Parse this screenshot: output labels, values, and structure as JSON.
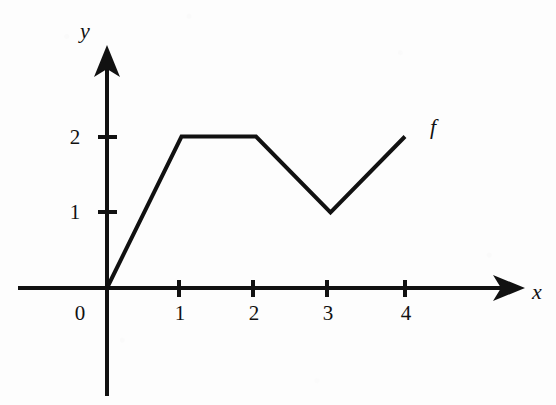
{
  "chart_data": {
    "type": "line",
    "title": "",
    "subtitle": "",
    "xlabel": "x",
    "ylabel": "y",
    "curve_label": "f",
    "x": [
      0,
      1,
      2,
      3,
      4
    ],
    "values": [
      0,
      2,
      2,
      1,
      2
    ],
    "series": [
      {
        "name": "f",
        "points": [
          {
            "x": 0,
            "y": 0
          },
          {
            "x": 1,
            "y": 2
          },
          {
            "x": 2,
            "y": 2
          },
          {
            "x": 3,
            "y": 1
          },
          {
            "x": 4,
            "y": 2
          }
        ]
      }
    ],
    "xlim": [
      -1.2,
      5.6
    ],
    "ylim": [
      -1.4,
      3.25
    ],
    "x_ticks": [
      1,
      2,
      3,
      4
    ],
    "x_tick_labels": [
      "1",
      "2",
      "3",
      "4"
    ],
    "y_ticks": [
      1,
      2
    ],
    "y_tick_labels": [
      "1",
      "2"
    ],
    "origin_label": "0",
    "grid": false,
    "legend": "none",
    "annotations": [
      "f"
    ],
    "axis_arrows": [
      "x-positive",
      "y-positive"
    ],
    "line_color": "#111111",
    "background_color": "#fdfdfd"
  },
  "labels": {
    "y_axis_name": "y",
    "x_axis_name": "x",
    "curve": "f",
    "origin": "0",
    "y_tick_2": "2",
    "y_tick_1": "1",
    "x_tick_1": "1",
    "x_tick_2": "2",
    "x_tick_3": "3",
    "x_tick_4": "4"
  }
}
